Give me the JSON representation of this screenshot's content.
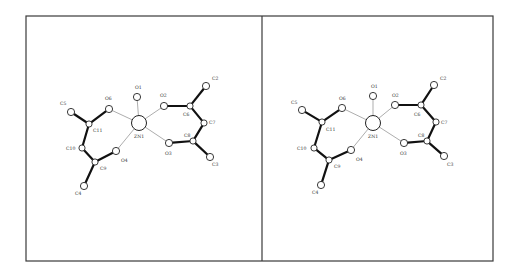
{
  "figure": {
    "type": "stereo-pair molecular structure",
    "frame": {
      "left": 26,
      "top": 16,
      "right": 493,
      "bottom": 261,
      "divider_x": 262
    },
    "colors": {
      "frame": "#3a3a3a",
      "covalent_bond": "#111111",
      "coordination_bond": "#8a8a8a",
      "atom_fill": "#ffffff",
      "atom_stroke": "#222222"
    }
  },
  "atoms": [
    "ZN1",
    "O1",
    "O2",
    "O3",
    "O4",
    "O6",
    "C2",
    "C3",
    "C4",
    "C5",
    "C6",
    "C7",
    "C8",
    "C9",
    "C10",
    "C11"
  ],
  "bonds": {
    "covalent": [
      [
        "O2",
        "C6"
      ],
      [
        "C6",
        "C2"
      ],
      [
        "C6",
        "C7"
      ],
      [
        "C7",
        "C8"
      ],
      [
        "C8",
        "O3"
      ],
      [
        "C8",
        "C3"
      ],
      [
        "O6",
        "C11"
      ],
      [
        "C11",
        "C5"
      ],
      [
        "C11",
        "C10"
      ],
      [
        "C10",
        "C9"
      ],
      [
        "C9",
        "O4"
      ],
      [
        "C9",
        "C4"
      ]
    ],
    "coordination": [
      [
        "ZN1",
        "O1"
      ],
      [
        "ZN1",
        "O2"
      ],
      [
        "ZN1",
        "O3"
      ],
      [
        "ZN1",
        "O4"
      ],
      [
        "ZN1",
        "O6"
      ]
    ]
  },
  "views": [
    {
      "name": "left-view",
      "positions": {
        "ZN1": [
          139,
          123,
          7.5
        ],
        "O1": [
          137,
          97,
          3.6
        ],
        "O2": [
          164,
          106,
          3.6
        ],
        "O3": [
          169,
          143,
          3.6
        ],
        "O4": [
          116,
          151,
          3.6
        ],
        "O6": [
          109,
          109,
          3.6
        ],
        "C2": [
          206,
          86,
          3.6
        ],
        "C3": [
          210,
          157,
          3.6
        ],
        "C4": [
          84,
          186,
          3.6
        ],
        "C5": [
          71,
          112,
          3.6
        ],
        "C6": [
          190,
          106,
          3.1
        ],
        "C7": [
          204,
          123,
          3.1
        ],
        "C8": [
          193,
          141,
          3.1
        ],
        "C9": [
          95,
          162,
          3.1
        ],
        "C10": [
          82,
          148,
          3.1
        ],
        "C11": [
          89,
          124,
          3.1
        ]
      },
      "labels": [
        {
          "text": "ZN1",
          "x": 134,
          "y": 138
        },
        {
          "text": "O1",
          "x": 135,
          "y": 89
        },
        {
          "text": "O2",
          "x": 160,
          "y": 97
        },
        {
          "text": "O3",
          "x": 165,
          "y": 155
        },
        {
          "text": "O4",
          "x": 121,
          "y": 162
        },
        {
          "text": "O6",
          "x": 105,
          "y": 100
        },
        {
          "text": "C2",
          "x": 212,
          "y": 80
        },
        {
          "text": "C3",
          "x": 212,
          "y": 166
        },
        {
          "text": "C4",
          "x": 75,
          "y": 195
        },
        {
          "text": "C5",
          "x": 60,
          "y": 105
        },
        {
          "text": "C6",
          "x": 183,
          "y": 116
        },
        {
          "text": "C7",
          "x": 209,
          "y": 124
        },
        {
          "text": "C8",
          "x": 184,
          "y": 137
        },
        {
          "text": "C9",
          "x": 100,
          "y": 170
        },
        {
          "text": "C10",
          "x": 66,
          "y": 150
        },
        {
          "text": "C11",
          "x": 93,
          "y": 132
        }
      ]
    },
    {
      "name": "right-view",
      "positions": {
        "ZN1": [
          373,
          123,
          7.5
        ],
        "O1": [
          373,
          96,
          3.6
        ],
        "O2": [
          395,
          105,
          3.6
        ],
        "O3": [
          404,
          143,
          3.6
        ],
        "O4": [
          351,
          150,
          3.6
        ],
        "O6": [
          342,
          108,
          3.6
        ],
        "C2": [
          434,
          85,
          3.6
        ],
        "C3": [
          444,
          156,
          3.6
        ],
        "C4": [
          321,
          185,
          3.6
        ],
        "C5": [
          302,
          110,
          3.6
        ],
        "C6": [
          421,
          105,
          3.1
        ],
        "C7": [
          436,
          122,
          3.1
        ],
        "C8": [
          427,
          141,
          3.1
        ],
        "C9": [
          329,
          160,
          3.1
        ],
        "C10": [
          314,
          148,
          3.1
        ],
        "C11": [
          322,
          122,
          3.1
        ]
      },
      "labels": [
        {
          "text": "ZN1",
          "x": 368,
          "y": 138
        },
        {
          "text": "O1",
          "x": 371,
          "y": 88
        },
        {
          "text": "O2",
          "x": 392,
          "y": 97
        },
        {
          "text": "O3",
          "x": 400,
          "y": 155
        },
        {
          "text": "O4",
          "x": 356,
          "y": 161
        },
        {
          "text": "O6",
          "x": 339,
          "y": 100
        },
        {
          "text": "C2",
          "x": 440,
          "y": 80
        },
        {
          "text": "C3",
          "x": 447,
          "y": 166
        },
        {
          "text": "C4",
          "x": 312,
          "y": 194
        },
        {
          "text": "C5",
          "x": 291,
          "y": 104
        },
        {
          "text": "C6",
          "x": 414,
          "y": 116
        },
        {
          "text": "C7",
          "x": 441,
          "y": 124
        },
        {
          "text": "C8",
          "x": 418,
          "y": 137
        },
        {
          "text": "C9",
          "x": 334,
          "y": 168
        },
        {
          "text": "C10",
          "x": 297,
          "y": 150
        },
        {
          "text": "C11",
          "x": 326,
          "y": 131
        }
      ]
    }
  ]
}
